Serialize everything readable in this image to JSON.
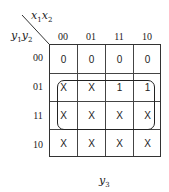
{
  "kmap": {
    "col_var": "x1x2",
    "row_var": "y1y2",
    "col_var_parts": [
      "x",
      "1",
      "x",
      "2"
    ],
    "row_var_parts": [
      "y",
      "1",
      "y",
      "2"
    ],
    "col_labels": [
      "00",
      "01",
      "11",
      "10"
    ],
    "row_labels": [
      "00",
      "01",
      "11",
      "10"
    ],
    "cells": [
      [
        "0",
        "0",
        "0",
        "0"
      ],
      [
        "X",
        "X",
        "1",
        "1"
      ],
      [
        "X",
        "X",
        "X",
        "X"
      ],
      [
        "X",
        "X",
        "X",
        "X"
      ]
    ],
    "groups": [
      {
        "rows": [
          "01",
          "11"
        ],
        "cols": [
          "00",
          "01",
          "11",
          "10"
        ]
      }
    ],
    "output_label_parts": [
      "y",
      "3"
    ],
    "output_label": "y3"
  }
}
